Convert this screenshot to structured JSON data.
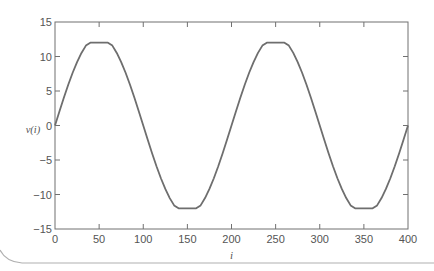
{
  "chart_data": {
    "type": "line",
    "title": "",
    "xlabel": "i",
    "ylabel": "v(i)",
    "xlim": [
      0,
      400
    ],
    "ylim": [
      -15,
      15
    ],
    "xticks": [
      0,
      50,
      100,
      150,
      200,
      250,
      300,
      350,
      400
    ],
    "yticks": [
      15,
      10,
      5,
      0,
      -5,
      -10,
      -15
    ],
    "grid": false,
    "legend": null,
    "series": [
      {
        "name": "v(i)",
        "color": "#6e6e6e",
        "description": "Clipped sinusoid, period 200, saturated at ±12",
        "x": [
          0,
          5,
          10,
          15,
          20,
          25,
          30,
          35,
          40,
          45,
          50,
          55,
          60,
          65,
          70,
          75,
          80,
          85,
          90,
          95,
          100,
          105,
          110,
          115,
          120,
          125,
          130,
          135,
          140,
          145,
          150,
          155,
          160,
          165,
          170,
          175,
          180,
          185,
          190,
          195,
          200,
          205,
          210,
          215,
          220,
          225,
          230,
          235,
          240,
          245,
          250,
          255,
          260,
          265,
          270,
          275,
          280,
          285,
          290,
          295,
          300,
          305,
          310,
          315,
          320,
          325,
          330,
          335,
          340,
          345,
          350,
          355,
          360,
          365,
          370,
          375,
          380,
          385,
          390,
          395,
          400
        ],
        "y": [
          0,
          2.03,
          4.02,
          5.9,
          7.64,
          9.19,
          10.52,
          11.58,
          12,
          12,
          12,
          12,
          12,
          11.58,
          10.52,
          9.19,
          7.64,
          5.9,
          4.02,
          2.03,
          0,
          -2.03,
          -4.02,
          -5.9,
          -7.64,
          -9.19,
          -10.52,
          -11.58,
          -12,
          -12,
          -12,
          -12,
          -12,
          -11.58,
          -10.52,
          -9.19,
          -7.64,
          -5.9,
          -4.02,
          -2.03,
          0,
          2.03,
          4.02,
          5.9,
          7.64,
          9.19,
          10.52,
          11.58,
          12,
          12,
          12,
          12,
          12,
          11.58,
          10.52,
          9.19,
          7.64,
          5.9,
          4.02,
          2.03,
          0,
          -2.03,
          -4.02,
          -5.9,
          -7.64,
          -9.19,
          -10.52,
          -11.58,
          -12,
          -12,
          -12,
          -12,
          -12,
          -11.58,
          -10.52,
          -9.19,
          -7.64,
          -5.9,
          -4.02,
          -2.03,
          0
        ]
      }
    ]
  }
}
